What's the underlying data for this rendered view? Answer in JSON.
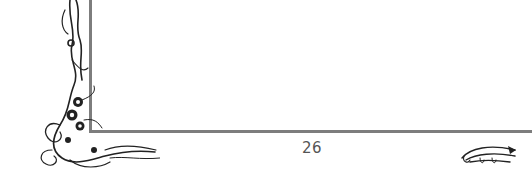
{
  "page": {
    "page_number": "26",
    "frame_color": "#7d7d7d",
    "ornaments": [
      {
        "name": "floral-corner-ornament-left",
        "description": "Victorian flourish with flowers along left and bottom-left corner"
      },
      {
        "name": "scroll-ornament-right",
        "description": "Curling scroll flourish at bottom right"
      }
    ]
  }
}
